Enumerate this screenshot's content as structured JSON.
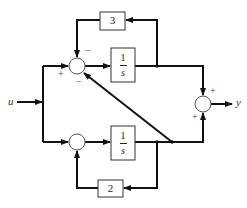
{
  "diagram": {
    "type": "block-diagram",
    "input": {
      "label": "u"
    },
    "output": {
      "label": "y"
    },
    "blocks": [
      {
        "id": "integrator-top",
        "num": "1",
        "den": "s"
      },
      {
        "id": "integrator-bottom",
        "num": "1",
        "den": "s"
      },
      {
        "id": "gain-top",
        "value": "3"
      },
      {
        "id": "gain-bottom",
        "value": "2"
      }
    ],
    "summers": {
      "top": {
        "signs": {
          "top": "−",
          "left": "+",
          "bottom": "−"
        }
      },
      "bottom": {
        "signs": {}
      },
      "output": {
        "signs": {
          "top": "+",
          "bottom": "+"
        }
      }
    },
    "colors": {
      "line": "#111111",
      "block_border": "#333333",
      "background": "#ffffff"
    }
  }
}
